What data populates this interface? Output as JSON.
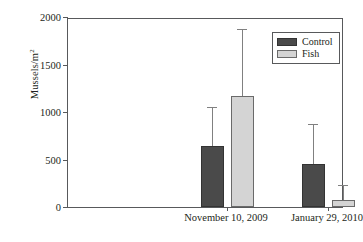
{
  "chart_data": {
    "type": "bar",
    "title": "",
    "xlabel": "",
    "ylabel": "Mussels/m",
    "ylabel_superscript": "2",
    "categories": [
      "November 10, 2009",
      "January 29, 2010"
    ],
    "ylim": [
      0,
      2000
    ],
    "ytick_labels": [
      "0",
      "500",
      "1000",
      "1500",
      "2000"
    ],
    "ytick_values": [
      0,
      500,
      1000,
      1500,
      2000
    ],
    "grid": false,
    "legend_position": "top-right",
    "error_bars": "upper-only",
    "series": [
      {
        "name": "Control",
        "color": "#4a4a4a",
        "values": [
          640,
          450
        ],
        "errors": [
          400,
          410
        ]
      },
      {
        "name": "Fish",
        "color": "#d4d4d4",
        "values": [
          1170,
          75
        ],
        "errors": [
          695,
          147
        ]
      }
    ]
  },
  "legend": {
    "items": [
      {
        "label": "Control"
      },
      {
        "label": "Fish"
      }
    ]
  },
  "axes": {
    "y_title": "Mussels/m",
    "y_title_sup": "2"
  },
  "colors": {
    "control": "#4a4a4a",
    "fish": "#d4d4d4",
    "axis": "#58595b",
    "error": "#808080",
    "background": "#ffffff"
  }
}
